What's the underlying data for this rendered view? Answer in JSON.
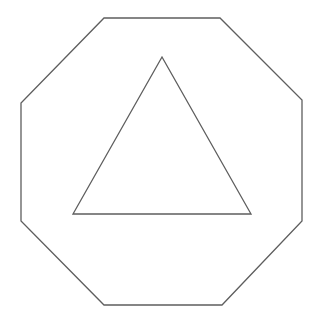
{
  "canvas": {
    "width": 319,
    "height": 323,
    "background": "#ffffff"
  },
  "stroke": {
    "color": "#5e5e5e",
    "width": 1.3
  },
  "shapes": {
    "octagon": {
      "label": "octagon",
      "points": "104,18 220,18 302,100 302,221 222,305 104,305 21,221 21,103"
    },
    "triangle": {
      "label": "triangle",
      "points": "162,57 251,214 73,214"
    }
  }
}
